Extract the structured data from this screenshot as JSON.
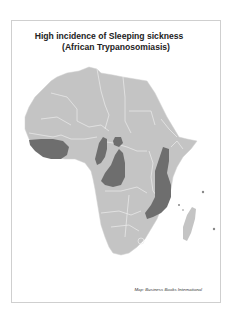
{
  "map": {
    "title_line1": "High incidence of Sleeping sickness",
    "title_line2": "(African Trypanosomiasis)",
    "credit": "Map: Business Books International",
    "colors": {
      "land": "#c4c4c4",
      "borders": "#ececec",
      "high_incidence": "#6e6e6e",
      "frame": "#cfcfcf"
    },
    "legend": "Dark shaded regions indicate high incidence",
    "regions_high_incidence": [
      "West Africa coastal belt",
      "Central African Republic / Cameroon north",
      "Cameroon / Gabon / Congo",
      "Democratic Republic of the Congo",
      "East Africa (Uganda, Tanzania, Zambia, Malawi, Mozambique)"
    ]
  }
}
